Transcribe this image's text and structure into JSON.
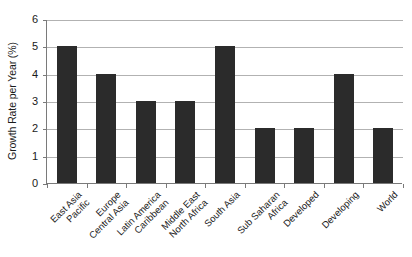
{
  "chart_data": {
    "type": "bar",
    "title": "",
    "subtitle": "",
    "xlabel": "",
    "ylabel": "Growth Rate per Year (%)",
    "categories": [
      "East Asia Pacific",
      "Europe Central Asia",
      "Latin America Caribbean",
      "Middle East North Africa",
      "South Asia",
      "Sub Saharan Africa",
      "Developed",
      "Developing",
      "World"
    ],
    "category_lines": [
      [
        "East Asia",
        "Pacific"
      ],
      [
        "Europe",
        "Central Asia"
      ],
      [
        "Latin America",
        "Caribbean"
      ],
      [
        "Middle East",
        "North Africa"
      ],
      [
        "South Asia",
        ""
      ],
      [
        "Sub Saharan",
        "Africa"
      ],
      [
        "Developed",
        ""
      ],
      [
        "Developing",
        ""
      ],
      [
        "World",
        ""
      ]
    ],
    "values": [
      5,
      4,
      3,
      3,
      5,
      2,
      2,
      4,
      2
    ],
    "ylim": [
      0,
      6
    ],
    "yticks": [
      0,
      1,
      2,
      3,
      4,
      5,
      6
    ],
    "ytick_labels": [
      "0",
      "1",
      "2",
      "3",
      "4",
      "5",
      "6"
    ],
    "grid": true,
    "grid_axis": "y",
    "legend": false,
    "legend_position": "none",
    "bar_color": "#2b2b2b",
    "gridline_color": "#b2b2b2",
    "axis_color": "#7a7a7a",
    "background_color": "#ffffff",
    "label_rotation_deg": -45
  }
}
